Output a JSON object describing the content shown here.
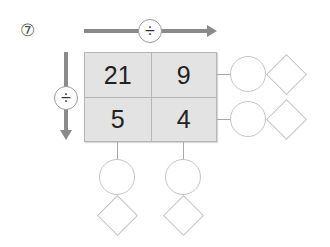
{
  "problem": {
    "number_label": "⑦"
  },
  "operators": {
    "horizontal": "÷",
    "vertical": "÷"
  },
  "grid": {
    "cells": [
      [
        "21",
        "9"
      ],
      [
        "5",
        "4"
      ]
    ]
  },
  "answer_slots": {
    "row_results": [
      {
        "circle": "",
        "diamond": ""
      },
      {
        "circle": "",
        "diamond": ""
      }
    ],
    "column_results": [
      {
        "circle": "",
        "diamond": ""
      },
      {
        "circle": "",
        "diamond": ""
      }
    ]
  },
  "colors": {
    "arrow": "#8a8a8a",
    "cell_bg": "#e3e3e3",
    "shape_border": "#c4c4c4"
  }
}
